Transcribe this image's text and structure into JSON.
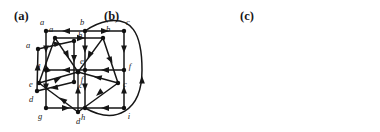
{
  "figure": {
    "background_color": "#ffffff",
    "ink_color": "#161616",
    "width": 380,
    "height": 132,
    "panels": [
      {
        "id": "a",
        "label": "(a)",
        "label_pos": {
          "x": 14,
          "y": 10
        },
        "type": "directed-graph",
        "shape": "quadrilateral-cycle",
        "vertices": [
          {
            "name": "a",
            "x": 38,
            "y": 49,
            "label_dx": -8,
            "label_dy": -1
          },
          {
            "name": "b",
            "x": 74,
            "y": 41,
            "label_dx": 4,
            "label_dy": -2
          },
          {
            "name": "c",
            "x": 74,
            "y": 82,
            "label_dx": 4,
            "label_dy": 5
          },
          {
            "name": "d",
            "x": 37,
            "y": 91,
            "label_dx": -8,
            "label_dy": 9
          }
        ],
        "edges": [
          {
            "from": "a",
            "to": "b",
            "direction": "a-to-b"
          },
          {
            "from": "b",
            "to": "c",
            "direction": "b-to-c"
          },
          {
            "from": "c",
            "to": "d",
            "direction": "c-to-d"
          },
          {
            "from": "d",
            "to": "a",
            "direction": "d-to-a"
          }
        ]
      },
      {
        "id": "b",
        "label": "(b)",
        "label_pos": {
          "x": 104,
          "y": 10
        },
        "type": "directed-graph",
        "shape": "wheel-five-spokes",
        "vertices": [
          {
            "name": "a",
            "x": 155,
            "y": 38,
            "label_dx": -4,
            "label_dy": -4
          },
          {
            "name": "b",
            "x": 203,
            "y": 38,
            "label_dx": 4,
            "label_dy": -4
          },
          {
            "name": "c",
            "x": 218,
            "y": 83,
            "label_dx": 5,
            "label_dy": 3
          },
          {
            "name": "d",
            "x": 178,
            "y": 112,
            "label_dx": -1,
            "label_dy": 11
          },
          {
            "name": "e",
            "x": 139,
            "y": 83,
            "label_dx": -8,
            "label_dy": 3
          },
          {
            "name": "f",
            "x": 178,
            "y": 72,
            "label_dx": 3,
            "label_dy": 9
          }
        ],
        "edges": [
          {
            "from": "a",
            "to": "b",
            "direction": "a-to-b"
          },
          {
            "from": "b",
            "to": "c",
            "direction": "b-to-c"
          },
          {
            "from": "c",
            "to": "d",
            "direction": "c-to-d"
          },
          {
            "from": "d",
            "to": "e",
            "direction": "d-to-e"
          },
          {
            "from": "e",
            "to": "a",
            "direction": "e-to-a"
          },
          {
            "from": "a",
            "to": "f",
            "direction": "a-to-f"
          },
          {
            "from": "b",
            "to": "f",
            "direction": "b-to-f"
          },
          {
            "from": "c",
            "to": "f",
            "direction": "c-to-f"
          },
          {
            "from": "d",
            "to": "f",
            "direction": "d-to-f"
          },
          {
            "from": "e",
            "to": "f",
            "direction": "e-to-f"
          }
        ]
      },
      {
        "id": "c",
        "label": "(c)",
        "label_pos": {
          "x": 240,
          "y": 10
        },
        "type": "directed-graph",
        "shape": "three-by-three-grid",
        "vertices": [
          {
            "name": "a",
            "x": 278,
            "y": 31,
            "label_dx": -2,
            "label_dy": -5
          },
          {
            "name": "b",
            "x": 317,
            "y": 31,
            "label_dx": -2,
            "label_dy": -5
          },
          {
            "name": "c",
            "x": 356,
            "y": 31,
            "label_dx": 2,
            "label_dy": -5
          },
          {
            "name": "d",
            "x": 278,
            "y": 70,
            "label_dx": -8,
            "label_dy": 2
          },
          {
            "name": "e",
            "x": 317,
            "y": 70,
            "label_dx": -2,
            "label_dy": -5
          },
          {
            "name": "f",
            "x": 356,
            "y": 70,
            "label_dx": 4,
            "label_dy": 2
          },
          {
            "name": "g",
            "x": 278,
            "y": 108,
            "label_dx": -7,
            "label_dy": 9
          },
          {
            "name": "h",
            "x": 317,
            "y": 108,
            "label_dx": -2,
            "label_dy": 10
          },
          {
            "name": "i",
            "x": 356,
            "y": 108,
            "label_dx": 3,
            "label_dy": 9
          }
        ],
        "edges": [
          {
            "from": "b",
            "to": "a",
            "direction": "b-to-a"
          },
          {
            "from": "b",
            "to": "c",
            "direction": "b-to-c"
          },
          {
            "from": "a",
            "to": "d",
            "direction": "a-to-d"
          },
          {
            "from": "b",
            "to": "e",
            "direction": "b-to-e"
          },
          {
            "from": "c",
            "to": "f",
            "direction": "c-to-f"
          },
          {
            "from": "e",
            "to": "d",
            "direction": "e-to-d"
          },
          {
            "from": "f",
            "to": "e",
            "direction": "f-to-e"
          },
          {
            "from": "d",
            "to": "g",
            "direction": "d-to-g"
          },
          {
            "from": "e",
            "to": "h",
            "direction": "e-to-h"
          },
          {
            "from": "i",
            "to": "f",
            "direction": "i-to-f"
          },
          {
            "from": "g",
            "to": "h",
            "direction": "g-to-h"
          },
          {
            "from": "i",
            "to": "h",
            "direction": "i-to-h"
          },
          {
            "from": "h",
            "to": "c",
            "direction": "h-to-c-curved",
            "style": "curved-around-right"
          }
        ]
      }
    ]
  }
}
